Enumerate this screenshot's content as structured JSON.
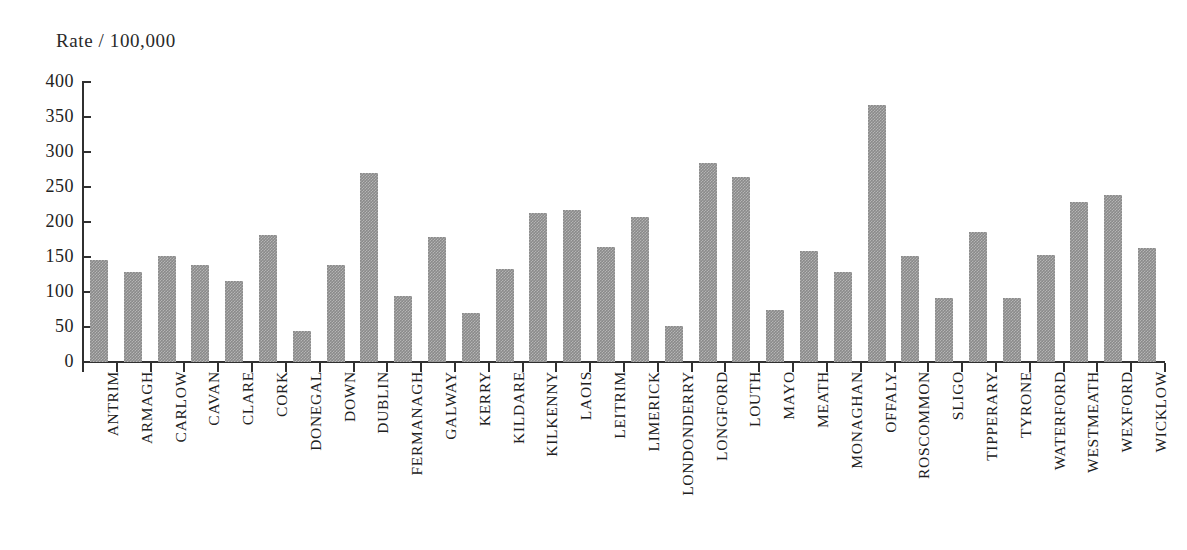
{
  "chart_data": {
    "type": "bar",
    "title": "",
    "ylabel": "Rate / 100,000",
    "xlabel": "",
    "ylim": [
      0,
      400
    ],
    "yticks": [
      0,
      50,
      100,
      150,
      200,
      250,
      300,
      350,
      400
    ],
    "ytick_labels": [
      "0",
      "50",
      "100",
      "150",
      "200",
      "250",
      "300",
      "350",
      "400"
    ],
    "grid": false,
    "legend": null,
    "bar_color": "#8a8a8a",
    "axis_color": "#303030",
    "categories": [
      "ANTRIM",
      "ARMAGH",
      "CARLOW",
      "CAVAN",
      "CLARE",
      "CORK",
      "DONEGAL",
      "DOWN",
      "DUBLIN",
      "FERMANAGH",
      "GALWAY",
      "KERRY",
      "KILDARE",
      "KILKENNY",
      "LAOIS",
      "LEITRIM",
      "LIMERICK",
      "LONDONDERRY",
      "LONGFORD",
      "LOUTH",
      "MAYO",
      "MEATH",
      "MONAGHAN",
      "OFFALY",
      "ROSCOMMON",
      "SLIGO",
      "TIPPERARY",
      "TYRONE",
      "WATERFORD",
      "WESTMEATH",
      "WEXFORD",
      "WICKLOW"
    ],
    "values": [
      146,
      128,
      151,
      138,
      116,
      181,
      44,
      138,
      270,
      94,
      179,
      70,
      133,
      213,
      217,
      165,
      207,
      51,
      284,
      265,
      75,
      158,
      128,
      367,
      152,
      91,
      186,
      91,
      153,
      229,
      238,
      163
    ]
  }
}
